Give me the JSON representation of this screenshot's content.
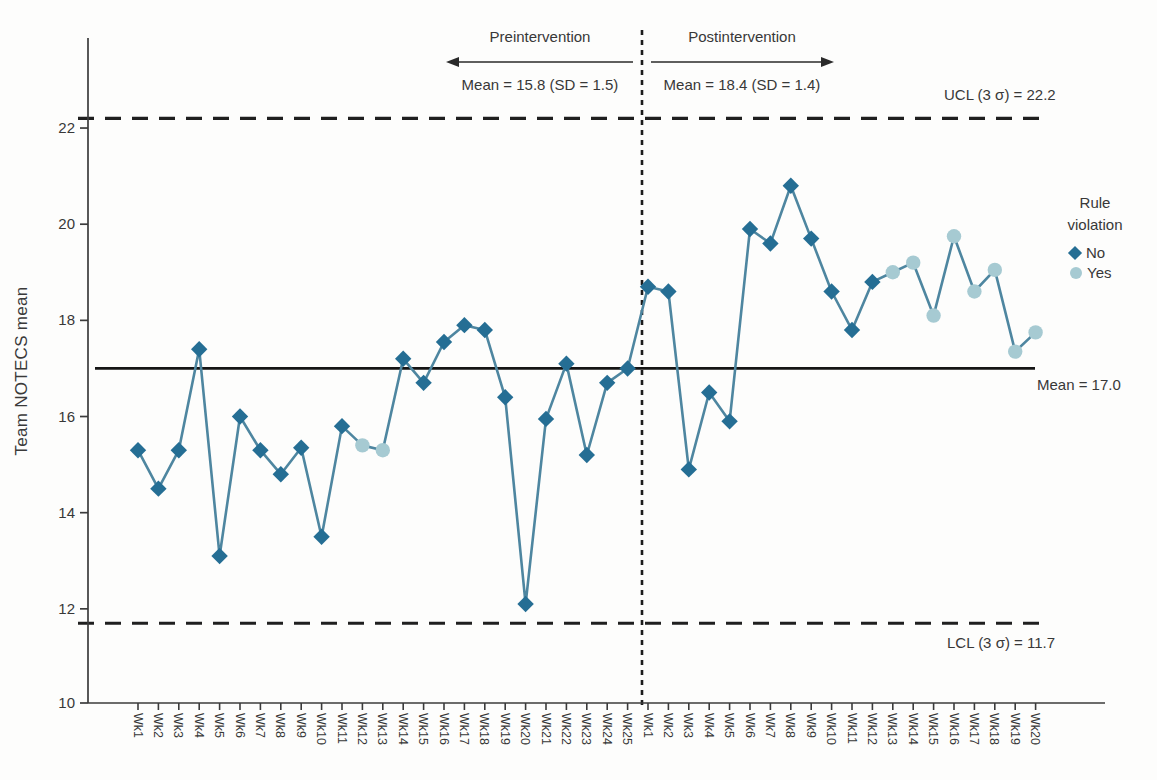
{
  "figure_title": "Team NOTECS statistical process control chart",
  "annotations": {
    "pre_label": "Preintervention",
    "pre_stats": "Mean = 15.8 (SD = 1.5)",
    "post_label": "Postintervention",
    "post_stats": "Mean = 18.4 (SD = 1.4)",
    "ucl_label": "UCL (3 σ) = 22.2",
    "lcl_label": "LCL (3 σ) = 11.7",
    "mean_label": "Mean = 17.0"
  },
  "legend": {
    "title": "Rule violation",
    "items": [
      {
        "label": "No",
        "marker": "diamond"
      },
      {
        "label": "Yes",
        "marker": "circle"
      }
    ]
  },
  "chart_data": {
    "type": "line",
    "title": "",
    "xlabel": "",
    "ylabel": "Team NOTECS mean",
    "ylim": [
      10,
      23.9
    ],
    "y_ticks": [
      10,
      12,
      14,
      16,
      18,
      20,
      22
    ],
    "grid": false,
    "legend_position": "right",
    "categories": [
      "Wk1",
      "Wk2",
      "Wk3",
      "Wk4",
      "Wk5",
      "Wk6",
      "Wk7",
      "Wk8",
      "Wk9",
      "Wk10",
      "Wk11",
      "Wk12",
      "Wk13",
      "Wk14",
      "Wk15",
      "Wk16",
      "Wk17",
      "Wk18",
      "Wk19",
      "Wk20",
      "Wk21",
      "Wk22",
      "Wk23",
      "Wk24",
      "Wk25",
      "Wk1",
      "Wk2",
      "Wk3",
      "Wk4",
      "Wk5",
      "Wk6",
      "Wk7",
      "Wk8",
      "Wk9",
      "Wk10",
      "Wk11",
      "Wk12",
      "Wk13",
      "Wk14",
      "Wk15",
      "Wk16",
      "Wk17",
      "Wk18",
      "Wk19",
      "Wk20"
    ],
    "series": [
      {
        "name": "Team NOTECS mean",
        "values": [
          15.3,
          14.5,
          15.3,
          17.4,
          13.1,
          16.0,
          15.3,
          14.8,
          15.35,
          13.5,
          15.8,
          15.4,
          15.3,
          17.2,
          16.7,
          17.55,
          17.9,
          17.8,
          16.4,
          12.1,
          15.95,
          17.1,
          15.2,
          16.7,
          17.0,
          18.7,
          18.6,
          14.9,
          16.5,
          15.9,
          19.9,
          19.6,
          20.8,
          19.7,
          18.6,
          17.8,
          18.8,
          19.0,
          19.2,
          18.1,
          19.75,
          18.6,
          19.05,
          17.35,
          17.75
        ],
        "rule_violation": [
          "no",
          "no",
          "no",
          "no",
          "no",
          "no",
          "no",
          "no",
          "no",
          "no",
          "no",
          "yes",
          "yes",
          "no",
          "no",
          "no",
          "no",
          "no",
          "no",
          "no",
          "no",
          "no",
          "no",
          "no",
          "no",
          "no",
          "no",
          "no",
          "no",
          "no",
          "no",
          "no",
          "no",
          "no",
          "no",
          "no",
          "no",
          "yes",
          "yes",
          "yes",
          "yes",
          "yes",
          "yes",
          "yes",
          "yes"
        ]
      }
    ],
    "reference_lines": {
      "ucl": 22.2,
      "lcl": 11.7,
      "mean": 17.0
    },
    "phases": [
      {
        "name": "Preintervention",
        "mean": 15.8,
        "sd": 1.5,
        "n_weeks": 25
      },
      {
        "name": "Postintervention",
        "mean": 18.4,
        "sd": 1.4,
        "n_weeks": 20
      }
    ],
    "phase_divider_after_index": 24,
    "colors": {
      "no_marker": "#256e94",
      "yes_marker": "#a6cad2",
      "line": "#4e86a0",
      "control_lines": "#1f1f1f",
      "axis": "#3b3b3b",
      "text": "#383838"
    }
  }
}
